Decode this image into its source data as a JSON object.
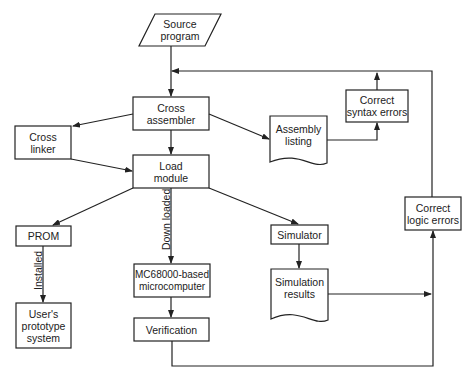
{
  "diagram": {
    "type": "flowchart",
    "nodes": {
      "source_program": "Source\nprogram",
      "cross_assembler": "Cross\nassembler",
      "cross_linker": "Cross\nlinker",
      "load_module": "Load\nmodule",
      "assembly_listing": "Assembly\nlisting",
      "correct_syntax_errors": "Correct\nsyntax errors",
      "prom": "PROM",
      "users_prototype_system": "User's\nprototype\nsystem",
      "mc68000_microcomputer": "MC68000-based\nmicrocomputer",
      "verification": "Verification",
      "simulator": "Simulator",
      "simulation_results": "Simulation\nresults",
      "correct_logic_errors": "Correct\nlogic errors"
    },
    "edge_labels": {
      "down_loaded": "Down loaded",
      "installed": "Installed"
    },
    "edges": [
      {
        "from": "Source program",
        "to": "Cross assembler"
      },
      {
        "from": "Cross assembler",
        "to": "Cross linker"
      },
      {
        "from": "Cross assembler",
        "to": "Load module"
      },
      {
        "from": "Cross assembler",
        "to": "Assembly listing"
      },
      {
        "from": "Cross linker",
        "to": "Load module"
      },
      {
        "from": "Assembly listing",
        "to": "Correct syntax errors"
      },
      {
        "from": "Correct syntax errors",
        "to": "Cross assembler"
      },
      {
        "from": "Load module",
        "to": "PROM"
      },
      {
        "from": "Load module",
        "to": "MC68000-based microcomputer",
        "label": "Down loaded"
      },
      {
        "from": "Load module",
        "to": "Simulator"
      },
      {
        "from": "PROM",
        "to": "User's prototype system",
        "label": "Installed"
      },
      {
        "from": "MC68000-based microcomputer",
        "to": "Verification"
      },
      {
        "from": "Simulator",
        "to": "Simulation results"
      },
      {
        "from": "Simulation results",
        "to": "Correct logic errors"
      },
      {
        "from": "Verification",
        "to": "Correct logic errors"
      },
      {
        "from": "Correct logic errors",
        "to": "Cross assembler"
      }
    ]
  }
}
